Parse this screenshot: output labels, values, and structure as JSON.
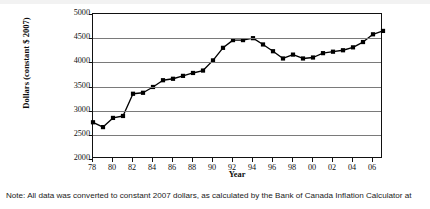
{
  "figure": {
    "note": "Note: All data was converted to constant 2007 dollars, as calculated by the Bank of Canada Inflation Calculator at"
  },
  "chart_data": {
    "type": "line",
    "title": "",
    "subtitle": "",
    "xlabel": "Year",
    "ylabel": "Dollars (constant $ 2007)",
    "xlim": [
      1978,
      2007
    ],
    "ylim": [
      2000,
      5000
    ],
    "yticks": [
      2000,
      2500,
      3000,
      3500,
      4000,
      4500,
      5000
    ],
    "ytick_labels": [
      "2000",
      "2500",
      "3000",
      "3500",
      "4000",
      "4500",
      "5000"
    ],
    "xticks": [
      1978,
      1980,
      1982,
      1984,
      1986,
      1988,
      1990,
      1992,
      1994,
      1996,
      1998,
      2000,
      2002,
      2004,
      2006
    ],
    "xtick_labels": [
      "78",
      "80",
      "82",
      "84",
      "86",
      "88",
      "90",
      "92",
      "94",
      "96",
      "98",
      "00",
      "02",
      "04",
      "06"
    ],
    "grid": true,
    "grid_axis": "y",
    "legend": "none",
    "marker": "square",
    "line_color": "#000000",
    "marker_color": "#000000",
    "x": [
      1978,
      1979,
      1980,
      1981,
      1982,
      1983,
      1984,
      1985,
      1986,
      1987,
      1988,
      1989,
      1990,
      1991,
      1992,
      1993,
      1994,
      1995,
      1996,
      1997,
      1998,
      1999,
      2000,
      2001,
      2002,
      2003,
      2004,
      2005,
      2006,
      2007
    ],
    "values": [
      2760,
      2660,
      2850,
      2890,
      3350,
      3370,
      3490,
      3630,
      3660,
      3720,
      3780,
      3830,
      4040,
      4300,
      4460,
      4460,
      4500,
      4370,
      4230,
      4080,
      4160,
      4080,
      4100,
      4190,
      4220,
      4250,
      4310,
      4420,
      4580,
      4650
    ],
    "series": [
      {
        "name": "Dollars (constant $ 2007)",
        "values": [
          2760,
          2660,
          2850,
          2890,
          3350,
          3370,
          3490,
          3630,
          3660,
          3720,
          3780,
          3830,
          4040,
          4300,
          4460,
          4460,
          4500,
          4370,
          4230,
          4080,
          4160,
          4080,
          4100,
          4190,
          4220,
          4250,
          4310,
          4420,
          4580,
          4650
        ]
      }
    ]
  }
}
